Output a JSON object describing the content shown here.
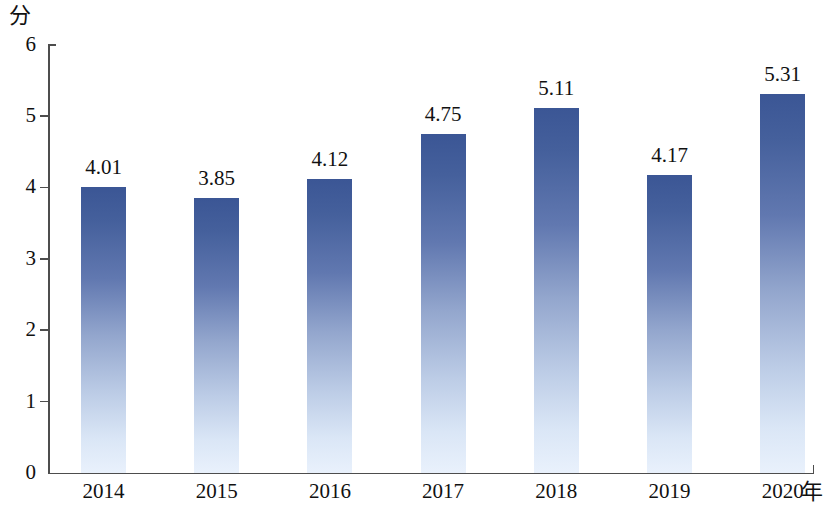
{
  "chart_data": {
    "type": "bar",
    "title": "",
    "subtitle": "",
    "xlabel": "年",
    "ylabel": "分",
    "categories": [
      "2014",
      "2015",
      "2016",
      "2017",
      "2018",
      "2019",
      "2020"
    ],
    "values": [
      4.01,
      3.85,
      4.12,
      4.75,
      5.11,
      4.17,
      5.31
    ],
    "value_labels": [
      "4.01",
      "3.85",
      "4.12",
      "4.75",
      "5.11",
      "4.17",
      "5.31"
    ],
    "ylim": [
      0,
      6
    ],
    "y_ticks": [
      0,
      1,
      2,
      3,
      4,
      5,
      6
    ],
    "y_tick_labels": [
      "0",
      "1",
      "2",
      "3",
      "4",
      "5",
      "6"
    ],
    "grid": false,
    "legend": null,
    "legend_position": "none",
    "series": [
      {
        "name": "",
        "values": [
          4.01,
          3.85,
          4.12,
          4.75,
          5.11,
          4.17,
          5.31
        ]
      }
    ],
    "colors": {
      "bar_top": "#3b5695",
      "bar_bottom": "#e9f1fc",
      "axis": "#4d4d4d",
      "text": "#111111",
      "background": "#ffffff"
    }
  }
}
